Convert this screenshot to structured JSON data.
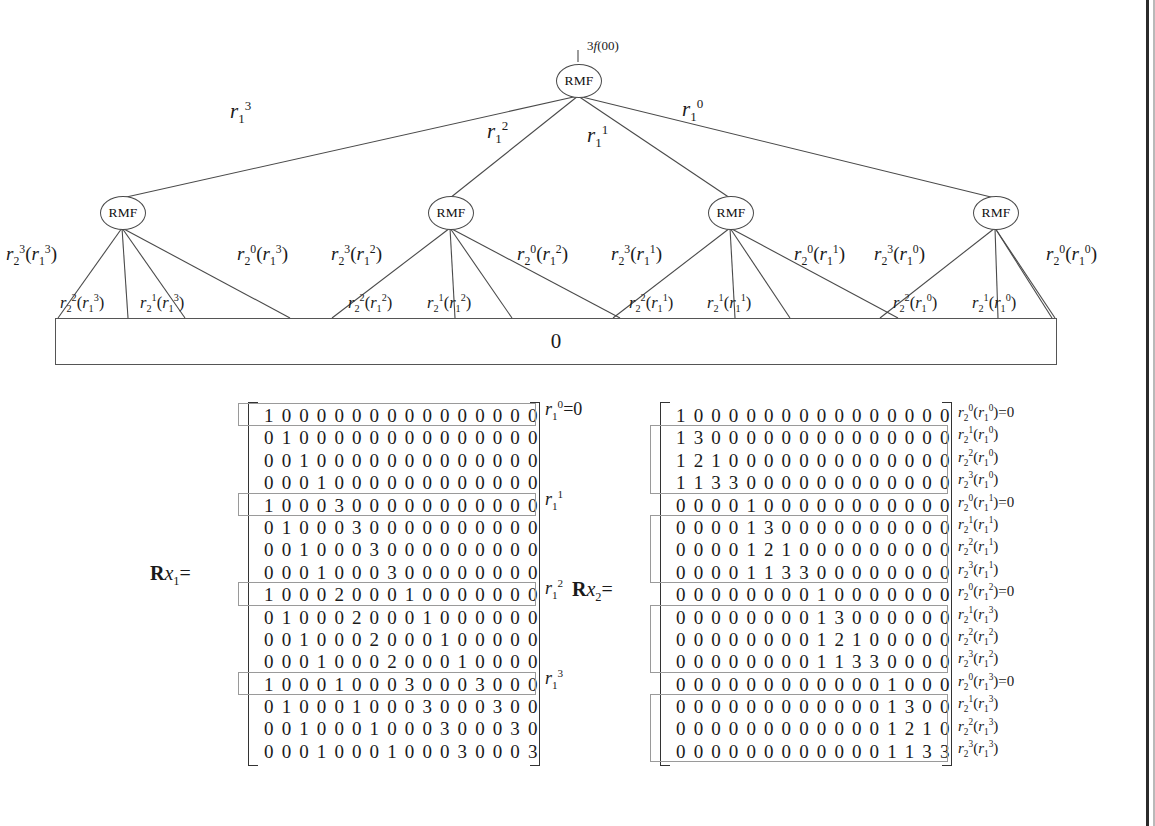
{
  "figure": {
    "root_annotation": "3f(00)",
    "node_label": "RMF",
    "baseline_label": "0",
    "level1_edge_labels": [
      "r13",
      "r12",
      "r11",
      "r10"
    ],
    "level2_groups": [
      {
        "parent": "r13",
        "outer_left": "r2^3(r1^3)",
        "inner_left": "r2^2(r1^3)",
        "inner_right": "r2^1(r1^3)",
        "outer_right": "r2^0(r1^3)"
      },
      {
        "parent": "r12",
        "outer_left": "r2^3(r1^2)",
        "inner_left": "r2^2(r1^2)",
        "inner_right": "r2^1(r1^2)",
        "outer_right": "r2^0(r1^2)"
      },
      {
        "parent": "r11",
        "outer_left": "r2^3(r1^1)",
        "inner_left": "r2^2(r1^1)",
        "inner_right": "r2^1(r1^1)",
        "outer_right": "r2^0(r1^1)"
      },
      {
        "parent": "r10",
        "outer_left": "r2^3(r1^0)",
        "inner_left": "r2^2(r1^0)",
        "inner_right": "r2^1(r1^0)",
        "outer_right": "r2^0(r1^0)"
      }
    ]
  },
  "matrix_left": {
    "name_plain": "Rx1",
    "name_bold": "R",
    "name_italic": "x",
    "name_sub": "1",
    "name_eq": "=",
    "rows": [
      [
        1,
        0,
        0,
        0,
        0,
        0,
        0,
        0,
        0,
        0,
        0,
        0,
        0,
        0,
        0,
        0
      ],
      [
        0,
        1,
        0,
        0,
        0,
        0,
        0,
        0,
        0,
        0,
        0,
        0,
        0,
        0,
        0,
        0
      ],
      [
        0,
        0,
        1,
        0,
        0,
        0,
        0,
        0,
        0,
        0,
        0,
        0,
        0,
        0,
        0,
        0
      ],
      [
        0,
        0,
        0,
        1,
        0,
        0,
        0,
        0,
        0,
        0,
        0,
        0,
        0,
        0,
        0,
        0
      ],
      [
        1,
        0,
        0,
        0,
        3,
        0,
        0,
        0,
        0,
        0,
        0,
        0,
        0,
        0,
        0,
        0
      ],
      [
        0,
        1,
        0,
        0,
        0,
        3,
        0,
        0,
        0,
        0,
        0,
        0,
        0,
        0,
        0,
        0
      ],
      [
        0,
        0,
        1,
        0,
        0,
        0,
        3,
        0,
        0,
        0,
        0,
        0,
        0,
        0,
        0,
        0
      ],
      [
        0,
        0,
        0,
        1,
        0,
        0,
        0,
        3,
        0,
        0,
        0,
        0,
        0,
        0,
        0,
        0
      ],
      [
        1,
        0,
        0,
        0,
        2,
        0,
        0,
        0,
        1,
        0,
        0,
        0,
        0,
        0,
        0,
        0
      ],
      [
        0,
        1,
        0,
        0,
        0,
        2,
        0,
        0,
        0,
        1,
        0,
        0,
        0,
        0,
        0,
        0
      ],
      [
        0,
        0,
        1,
        0,
        0,
        0,
        2,
        0,
        0,
        0,
        1,
        0,
        0,
        0,
        0,
        0
      ],
      [
        0,
        0,
        0,
        1,
        0,
        0,
        0,
        2,
        0,
        0,
        0,
        1,
        0,
        0,
        0,
        0
      ],
      [
        1,
        0,
        0,
        0,
        1,
        0,
        0,
        0,
        3,
        0,
        0,
        0,
        3,
        0,
        0,
        0
      ],
      [
        0,
        1,
        0,
        0,
        0,
        1,
        0,
        0,
        0,
        3,
        0,
        0,
        0,
        3,
        0,
        0
      ],
      [
        0,
        0,
        1,
        0,
        0,
        0,
        1,
        0,
        0,
        0,
        3,
        0,
        0,
        0,
        3,
        0
      ],
      [
        0,
        0,
        0,
        1,
        0,
        0,
        0,
        1,
        0,
        0,
        0,
        3,
        0,
        0,
        0,
        3
      ]
    ],
    "highlight_rows": [
      0,
      4,
      8,
      12
    ],
    "row_labels": [
      {
        "row": 0,
        "text": "r10=0"
      },
      {
        "row": 4,
        "text": "r11"
      },
      {
        "row": 8,
        "text": "r12"
      },
      {
        "row": 12,
        "text": "r13"
      }
    ]
  },
  "matrix_right": {
    "name_bold": "R",
    "name_italic": "x",
    "name_sub": "2",
    "name_eq": "=",
    "rows": [
      [
        1,
        0,
        0,
        0,
        0,
        0,
        0,
        0,
        0,
        0,
        0,
        0,
        0,
        0,
        0,
        0
      ],
      [
        1,
        3,
        0,
        0,
        0,
        0,
        0,
        0,
        0,
        0,
        0,
        0,
        0,
        0,
        0,
        0
      ],
      [
        1,
        2,
        1,
        0,
        0,
        0,
        0,
        0,
        0,
        0,
        0,
        0,
        0,
        0,
        0,
        0
      ],
      [
        1,
        1,
        3,
        3,
        0,
        0,
        0,
        0,
        0,
        0,
        0,
        0,
        0,
        0,
        0,
        0
      ],
      [
        0,
        0,
        0,
        0,
        1,
        0,
        0,
        0,
        0,
        0,
        0,
        0,
        0,
        0,
        0,
        0
      ],
      [
        0,
        0,
        0,
        0,
        1,
        3,
        0,
        0,
        0,
        0,
        0,
        0,
        0,
        0,
        0,
        0
      ],
      [
        0,
        0,
        0,
        0,
        1,
        2,
        1,
        0,
        0,
        0,
        0,
        0,
        0,
        0,
        0,
        0
      ],
      [
        0,
        0,
        0,
        0,
        1,
        1,
        3,
        3,
        0,
        0,
        0,
        0,
        0,
        0,
        0,
        0
      ],
      [
        0,
        0,
        0,
        0,
        0,
        0,
        0,
        0,
        1,
        0,
        0,
        0,
        0,
        0,
        0,
        0
      ],
      [
        0,
        0,
        0,
        0,
        0,
        0,
        0,
        0,
        1,
        3,
        0,
        0,
        0,
        0,
        0,
        0
      ],
      [
        0,
        0,
        0,
        0,
        0,
        0,
        0,
        0,
        1,
        2,
        1,
        0,
        0,
        0,
        0,
        0
      ],
      [
        0,
        0,
        0,
        0,
        0,
        0,
        0,
        0,
        1,
        1,
        3,
        3,
        0,
        0,
        0,
        0
      ],
      [
        0,
        0,
        0,
        0,
        0,
        0,
        0,
        0,
        0,
        0,
        0,
        0,
        1,
        0,
        0,
        0
      ],
      [
        0,
        0,
        0,
        0,
        0,
        0,
        0,
        0,
        0,
        0,
        0,
        0,
        1,
        3,
        0,
        0
      ],
      [
        0,
        0,
        0,
        0,
        0,
        0,
        0,
        0,
        0,
        0,
        0,
        0,
        1,
        2,
        1,
        0
      ],
      [
        0,
        0,
        0,
        0,
        0,
        0,
        0,
        0,
        0,
        0,
        0,
        0,
        1,
        1,
        3,
        3
      ]
    ],
    "group_boxes": [
      [
        1,
        3
      ],
      [
        5,
        7
      ],
      [
        9,
        11
      ],
      [
        13,
        15
      ]
    ],
    "row_labels": [
      {
        "row": 0,
        "base": "r",
        "sub": "2",
        "sup": "0",
        "arg_sub": "1",
        "arg_sup": "0",
        "suffix": "=0"
      },
      {
        "row": 1,
        "base": "r",
        "sub": "2",
        "sup": "1",
        "arg_sub": "1",
        "arg_sup": "0",
        "suffix": ""
      },
      {
        "row": 2,
        "base": "r",
        "sub": "2",
        "sup": "2",
        "arg_sub": "1",
        "arg_sup": "0",
        "suffix": ""
      },
      {
        "row": 3,
        "base": "r",
        "sub": "2",
        "sup": "3",
        "arg_sub": "1",
        "arg_sup": "0",
        "suffix": ""
      },
      {
        "row": 4,
        "base": "r",
        "sub": "2",
        "sup": "0",
        "arg_sub": "1",
        "arg_sup": "1",
        "suffix": "=0"
      },
      {
        "row": 5,
        "base": "r",
        "sub": "2",
        "sup": "1",
        "arg_sub": "1",
        "arg_sup": "1",
        "suffix": ""
      },
      {
        "row": 6,
        "base": "r",
        "sub": "2",
        "sup": "2",
        "arg_sub": "1",
        "arg_sup": "1",
        "suffix": ""
      },
      {
        "row": 7,
        "base": "r",
        "sub": "2",
        "sup": "3",
        "arg_sub": "1",
        "arg_sup": "1",
        "suffix": ""
      },
      {
        "row": 8,
        "base": "r",
        "sub": "2",
        "sup": "0",
        "arg_sub": "1",
        "arg_sup": "2",
        "suffix": "=0"
      },
      {
        "row": 9,
        "base": "r",
        "sub": "2",
        "sup": "1",
        "arg_sub": "1",
        "arg_sup": "3",
        "suffix": ""
      },
      {
        "row": 10,
        "base": "r",
        "sub": "2",
        "sup": "2",
        "arg_sub": "1",
        "arg_sup": "2",
        "suffix": ""
      },
      {
        "row": 11,
        "base": "r",
        "sub": "2",
        "sup": "3",
        "arg_sub": "1",
        "arg_sup": "2",
        "suffix": ""
      },
      {
        "row": 12,
        "base": "r",
        "sub": "2",
        "sup": "0",
        "arg_sub": "1",
        "arg_sup": "3",
        "suffix": "=0"
      },
      {
        "row": 13,
        "base": "r",
        "sub": "2",
        "sup": "1",
        "arg_sub": "1",
        "arg_sup": "3",
        "suffix": ""
      },
      {
        "row": 14,
        "base": "r",
        "sub": "2",
        "sup": "2",
        "arg_sub": "1",
        "arg_sup": "3",
        "suffix": ""
      },
      {
        "row": 15,
        "base": "r",
        "sub": "2",
        "sup": "3",
        "arg_sub": "1",
        "arg_sup": "3",
        "suffix": ""
      }
    ]
  },
  "colors": {
    "ink": "#1a1a1a",
    "line": "#4a4a4a",
    "highlight_border": "#9a9a9a",
    "page_edge": "#2b2b2b",
    "background": "#ffffff"
  }
}
